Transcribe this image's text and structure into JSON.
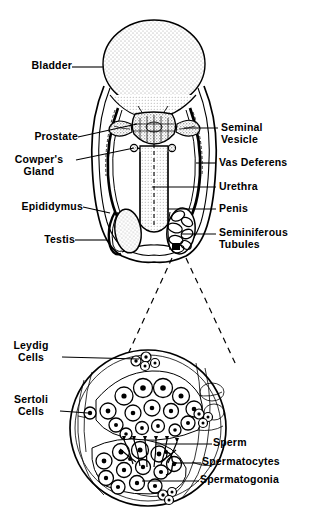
{
  "figure": {
    "background_color": "#ffffff",
    "ink_color": "#000000",
    "stipple_color": "#3a3a3a"
  },
  "upper_diagram": {
    "name": "male-reproductive-system-sagittal",
    "labels_left": [
      {
        "id": "bladder",
        "text": "Bladder",
        "x": 16,
        "y": 64,
        "leader_to_x": 104,
        "leader_to_y": 69
      },
      {
        "id": "prostate",
        "text": "Prostate",
        "x": 16,
        "y": 136,
        "leader_to_x": 137,
        "leader_to_y": 124
      },
      {
        "id": "cowpers-gland",
        "text": "Cowper's\nGland",
        "x": 13,
        "y": 160,
        "leader_to_x": 134,
        "leader_to_y": 148
      },
      {
        "id": "epididymus",
        "text": "Epididymus",
        "x": 11,
        "y": 203,
        "leader_to_x": 110,
        "leader_to_y": 212
      },
      {
        "id": "testis",
        "text": "Testis",
        "x": 40,
        "y": 237,
        "leader_to_x": 107,
        "leader_to_y": 240
      }
    ],
    "labels_right": [
      {
        "id": "seminal-vesicle",
        "text": "Seminal\nVesicle",
        "x": 224,
        "y": 122,
        "leader_to_x": 184,
        "leader_to_y": 128
      },
      {
        "id": "vas-deferens",
        "text": "Vas Deferens",
        "x": 219,
        "y": 159,
        "leader_to_x": 196,
        "leader_to_y": 163
      },
      {
        "id": "urethra",
        "text": "Urethra",
        "x": 219,
        "y": 183,
        "leader_to_x": 152,
        "leader_to_y": 187
      },
      {
        "id": "penis",
        "text": "Penis",
        "x": 219,
        "y": 205,
        "leader_to_x": 168,
        "leader_to_y": 209
      },
      {
        "id": "seminiferous-tubules",
        "text": "Seminiferous\nTubules",
        "x": 219,
        "y": 229,
        "leader_to_x": 182,
        "leader_to_y": 233
      }
    ]
  },
  "lower_diagram": {
    "name": "seminiferous-tubule-cross-section",
    "labels_left": [
      {
        "id": "leydig-cells",
        "text": "Leydig\nCells",
        "x": 21,
        "y": 345,
        "leader_to_x": 139,
        "leader_to_y": 359
      },
      {
        "id": "sertoli-cells",
        "text": "Sertoli\nCells",
        "x": 19,
        "y": 396,
        "leader_to_x": 88,
        "leader_to_y": 413
      }
    ],
    "labels_right": [
      {
        "id": "sperm",
        "text": "Sperm",
        "x": 214,
        "y": 440,
        "leader_to_x": 156,
        "leader_to_y": 444
      },
      {
        "id": "spermatocytes",
        "text": "Spermatocytes",
        "x": 203,
        "y": 458,
        "leader_to_x": 163,
        "leader_to_y": 462
      },
      {
        "id": "spermatogonia",
        "text": "Spermatogonia",
        "x": 201,
        "y": 477,
        "leader_to_x": 142,
        "leader_to_y": 481
      }
    ]
  }
}
